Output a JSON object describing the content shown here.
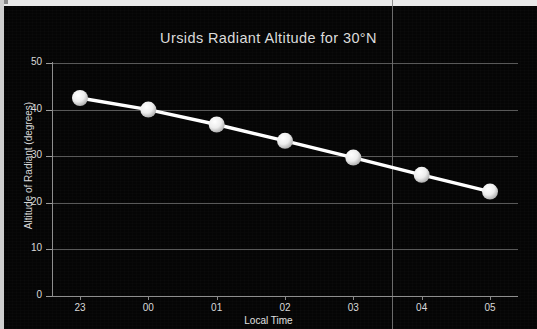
{
  "chart_data": {
    "type": "line",
    "title": "Ursids Radiant Altitude for 30°N",
    "xlabel": "Local Time",
    "ylabel": "Altitude of Radiant (degrees)",
    "categories": [
      "23",
      "00",
      "01",
      "02",
      "03",
      "04",
      "05"
    ],
    "values": [
      42.5,
      40.0,
      36.8,
      33.3,
      29.7,
      26.0,
      22.4
    ],
    "series": [
      {
        "name": "Altitude of Radiant",
        "values": [
          42.5,
          40.0,
          36.8,
          33.3,
          29.7,
          26.0,
          22.4
        ]
      }
    ],
    "ylim": [
      0,
      50
    ],
    "yticks": [
      "0",
      "10",
      "20",
      "30",
      "40",
      "50"
    ],
    "ytick_values": [
      0,
      10,
      20,
      30,
      40,
      50
    ],
    "xticks": [
      "23",
      "00",
      "01",
      "02",
      "03",
      "04",
      "05"
    ],
    "grid": "horizontal",
    "legend": "none",
    "background_color": "#000000",
    "line_color": "#ffffff",
    "marker_color": "#f0f0f0",
    "text_color": "#dcdcdc",
    "gridline_color": "#6e6e6e"
  }
}
